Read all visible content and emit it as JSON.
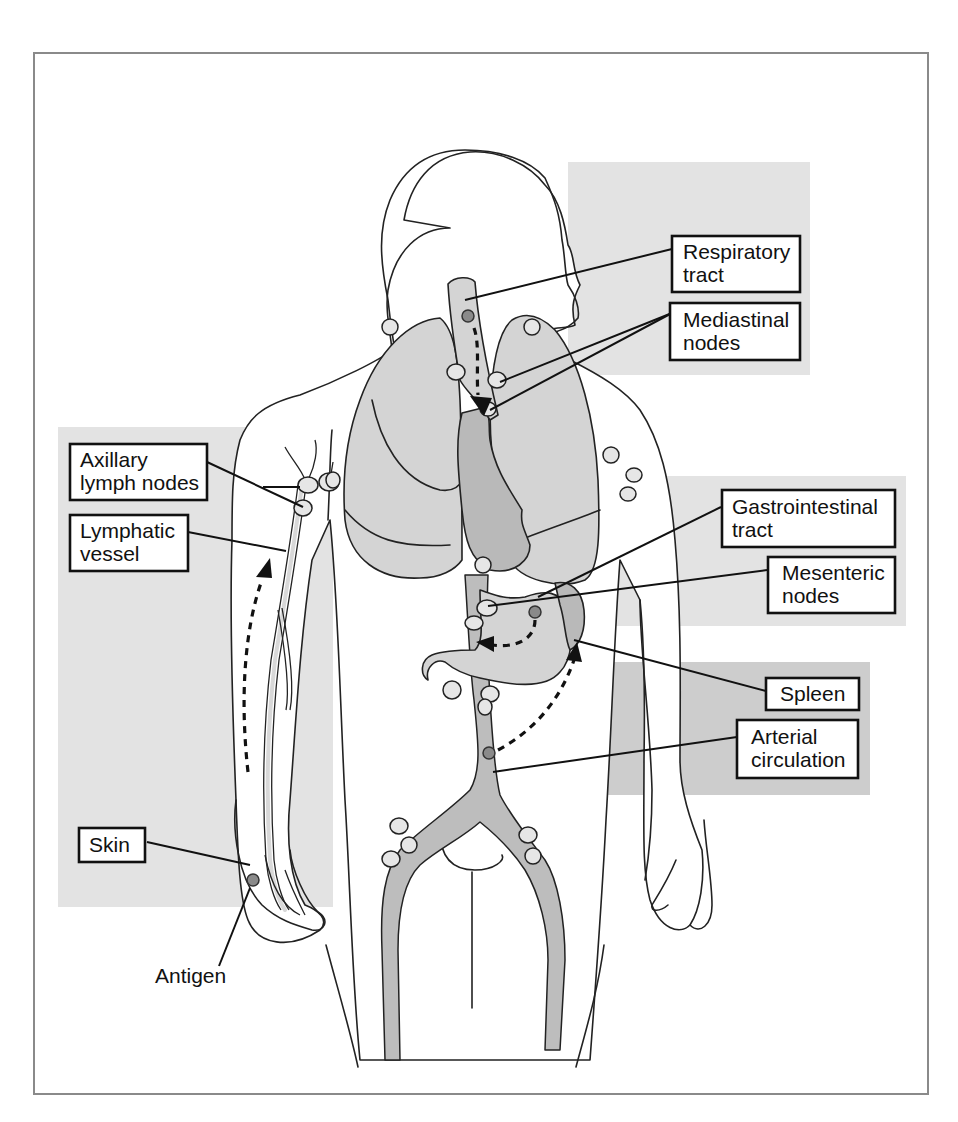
{
  "figure": {
    "colors": {
      "panel_light": "#e3e3e3",
      "panel_dark": "#cdcdcd",
      "organ": "#d4d4d4",
      "organ_dark": "#b9b9b9",
      "antigen": "#8a8a8a",
      "frame": "#8a8a8a"
    },
    "labels": {
      "respiratory_tract": {
        "line1": "Respiratory",
        "line2": "tract"
      },
      "mediastinal_nodes": {
        "line1": "Mediastinal",
        "line2": "nodes"
      },
      "axillary_lymph_nodes": {
        "line1": "Axillary",
        "line2": "lymph nodes"
      },
      "lymphatic_vessel": {
        "line1": "Lymphatic",
        "line2": "vessel"
      },
      "gastrointestinal_tract": {
        "line1": "Gastrointestinal",
        "line2": "tract"
      },
      "mesenteric_nodes": {
        "line1": "Mesenteric",
        "line2": "nodes"
      },
      "spleen": {
        "line1": "Spleen"
      },
      "arterial_circulation": {
        "line1": "Arterial",
        "line2": "circulation"
      },
      "skin": {
        "line1": "Skin"
      },
      "antigen": {
        "line1": "Antigen"
      }
    },
    "flows": [
      {
        "name": "respiratory-to-mediastinal",
        "from": "Respiratory tract",
        "to": "Mediastinal nodes"
      },
      {
        "name": "skin-to-axillary",
        "from": "Skin",
        "to": "Axillary lymph nodes"
      },
      {
        "name": "gi-to-mesenteric",
        "from": "Gastrointestinal tract",
        "to": "Mesenteric nodes"
      },
      {
        "name": "arterial-to-spleen",
        "from": "Arterial circulation",
        "to": "Spleen"
      }
    ]
  }
}
